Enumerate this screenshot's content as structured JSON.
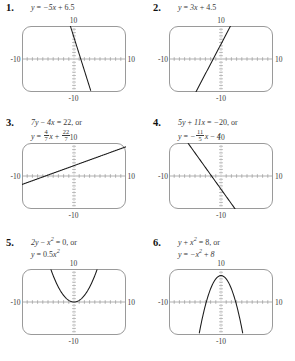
{
  "document": {
    "kind": "math-exercise-answer-key",
    "columns": 2,
    "rows": 3,
    "problem_count": 6
  },
  "graph_window": {
    "xmin": -10,
    "xmax": 10,
    "ymin": -10,
    "ymax": 10,
    "x_left_label": "-10",
    "x_right_label": "10",
    "y_top_label": "10",
    "y_bottom_label": "-10",
    "x_tick_count": 20,
    "y_tick_count": 20,
    "frame_color": "#9a9a9a",
    "axis_color": "#8f8f8f",
    "curve_color": "#1a1a1a"
  },
  "problems": [
    {
      "number": "1.",
      "equations": [
        "y = -5x + 6.5"
      ],
      "eq_html": [
        "<span class=\"eq\">y <span class=\"rm\">=</span> &minus;5x <span class=\"rm\">+</span> <span class=\"num\">6.5</span></span>"
      ],
      "graph": {
        "type": "line",
        "slope": -5,
        "intercept": 6.5,
        "x_intercept": 1.3,
        "form": "y = -5x + 6.5"
      }
    },
    {
      "number": "2.",
      "equations": [
        "y = 3x + 4.5"
      ],
      "eq_html": [
        "<span class=\"eq\">y <span class=\"rm\">=</span> 3x <span class=\"rm\">+</span> <span class=\"num\">4.5</span></span>"
      ],
      "graph": {
        "type": "line",
        "slope": 3,
        "intercept": 4.5,
        "x_intercept": -1.5,
        "form": "y = 3x + 4.5"
      }
    },
    {
      "number": "3.",
      "equations": [
        "7y - 4x = 22, or",
        "y = 4/7 x + 22/7"
      ],
      "eq_html": [
        "<span class=\"eq\">7y <span class=\"rm\">&minus;</span> 4x <span class=\"rm\">= 22, or</span></span>",
        "<span class=\"eq\">y <span class=\"rm\">=</span> <span class=\"frac\"><span class=\"n\">4</span><span class=\"d\">7</span></span>x <span class=\"rm\">+</span> <span class=\"frac\"><span class=\"n\">22</span><span class=\"d\">7</span></span></span>"
      ],
      "graph": {
        "type": "line",
        "slope": 0.5714,
        "intercept": 3.1429,
        "x_intercept": -5.5,
        "form": "y = (4/7)x + 22/7"
      }
    },
    {
      "number": "4.",
      "equations": [
        "5y + 11x = -20, or",
        "y = -11/5 x - 4"
      ],
      "eq_html": [
        "<span class=\"eq\">5y <span class=\"rm\">+</span> 11x <span class=\"rm\">=</span> &minus;<span class=\"num\">20</span><span class=\"rm\">, or</span></span>",
        "<span class=\"eq\">y <span class=\"rm\">=</span> &minus;<span class=\"frac\"><span class=\"n\">11</span><span class=\"d\">5</span></span>x <span class=\"rm\">&minus;</span> 4</span>"
      ],
      "graph": {
        "type": "line",
        "slope": -2.2,
        "intercept": -4,
        "x_intercept": -1.818,
        "form": "y = -(11/5)x - 4"
      }
    },
    {
      "number": "5.",
      "equations": [
        "2y - x^2 = 0, or",
        "y = 0.5x^2"
      ],
      "eq_html": [
        "<span class=\"eq\">2y <span class=\"rm\">&minus;</span> x<sup>2</sup> <span class=\"rm\">= 0, or</span></span>",
        "<span class=\"eq\">y <span class=\"rm\">=</span> <span class=\"num\">0.5</span>x<sup>2</sup></span>"
      ],
      "graph": {
        "type": "parabola",
        "a": 0.5,
        "c": 0,
        "vertex": [
          0,
          0
        ],
        "opens": "up",
        "form": "y = 0.5x^2"
      }
    },
    {
      "number": "6.",
      "equations": [
        "y + x^2 = 8, or",
        "y = -x^2 + 8"
      ],
      "eq_html": [
        "<span class=\"eq\">y <span class=\"rm\">+</span> x<sup>2</sup> <span class=\"rm\">= 8, or</span></span>",
        "<span class=\"eq\">y <span class=\"rm\">=</span> &minus;x<sup>2</sup> <span class=\"rm\">+</span> 8</span>"
      ],
      "graph": {
        "type": "parabola",
        "a": -1,
        "c": 8,
        "vertex": [
          0,
          8
        ],
        "opens": "down",
        "form": "y = -x^2 + 8"
      }
    }
  ]
}
